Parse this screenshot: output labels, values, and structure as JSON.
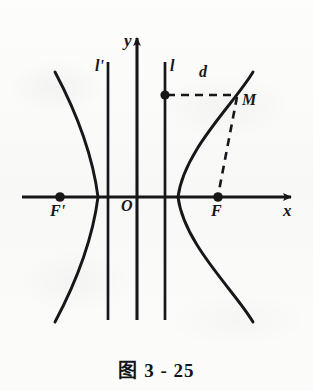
{
  "figure": {
    "caption": "图 3 - 25",
    "background_color": "#fbfbfa",
    "ink_color": "#17171a",
    "width": 313,
    "height": 391
  },
  "axes": {
    "x_axis": {
      "label": "x",
      "y_pixel": 197,
      "x_start": 22,
      "x_end": 295,
      "arrow": "right"
    },
    "y_axis": {
      "label": "y",
      "x_pixel": 137,
      "y_top": 34,
      "y_bottom": 320,
      "arrow": "up"
    },
    "origin": {
      "label": "O",
      "x": 137,
      "y": 197
    }
  },
  "curve": {
    "type": "hyperbola",
    "opens": "horizontal",
    "center_x": 137,
    "center_y": 197,
    "vertex_left_x": 98,
    "vertex_right_x": 178,
    "semi_major_a": 39,
    "branches": [
      {
        "name": "left-branch",
        "direction": "left"
      },
      {
        "name": "right-branch",
        "direction": "right"
      }
    ]
  },
  "directrices": [
    {
      "label": "l'",
      "x": 108,
      "y_top": 62,
      "y_bottom": 320
    },
    {
      "label": "l",
      "x": 165,
      "y_top": 62,
      "y_bottom": 320
    }
  ],
  "points": [
    {
      "label": "F'",
      "x": 60,
      "y": 197,
      "role": "left-focus"
    },
    {
      "label": "F",
      "x": 218,
      "y": 197,
      "role": "right-focus"
    },
    {
      "label": "M",
      "x": 237,
      "y": 95,
      "role": "point-on-curve"
    },
    {
      "label": "",
      "x": 165,
      "y": 95,
      "role": "foot-on-directrix"
    }
  ],
  "segments": [
    {
      "name": "distance-to-directrix",
      "label": "d",
      "style": "dashed",
      "from": {
        "x": 165,
        "y": 95
      },
      "to": {
        "x": 237,
        "y": 95
      }
    },
    {
      "name": "focal-radius",
      "label": "",
      "style": "dashed",
      "from": {
        "x": 237,
        "y": 95
      },
      "to": {
        "x": 218,
        "y": 197
      }
    }
  ]
}
